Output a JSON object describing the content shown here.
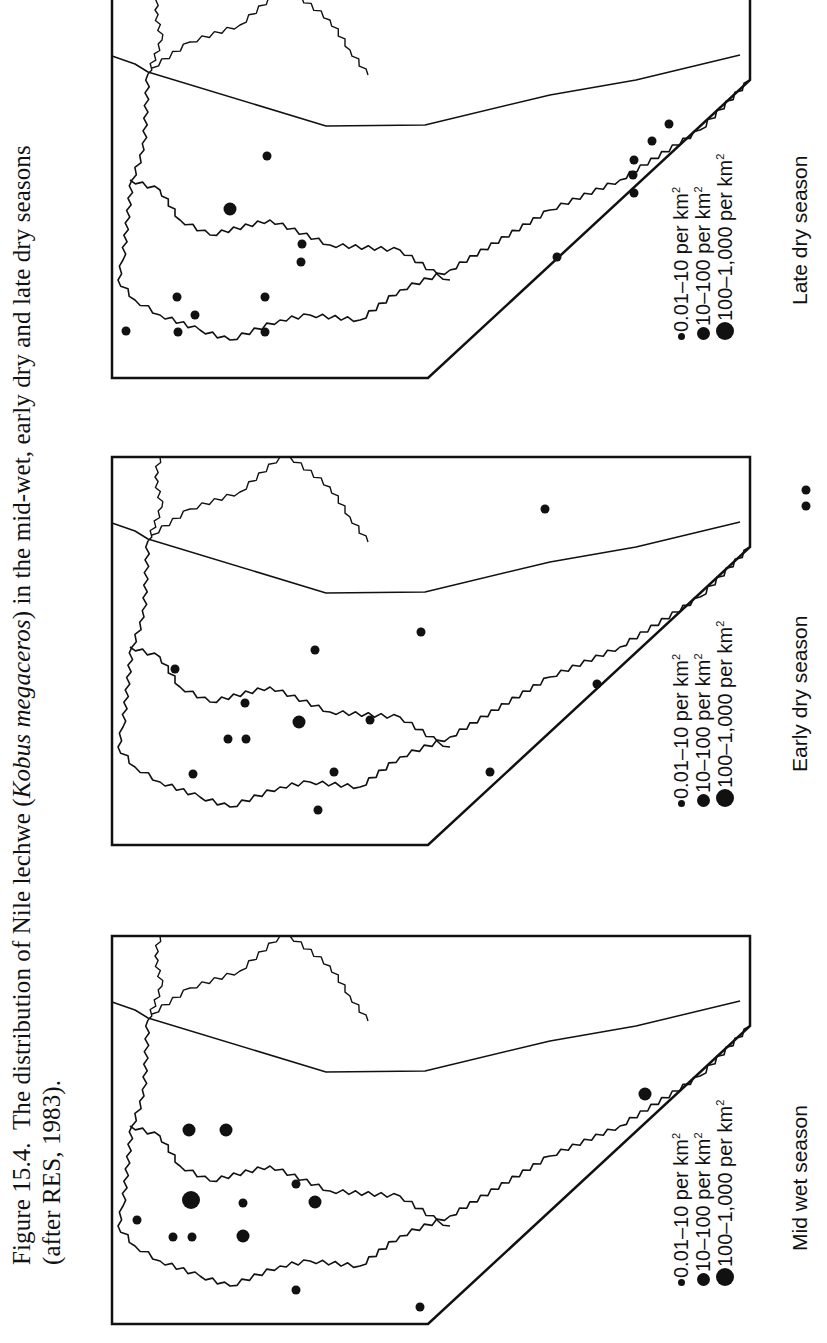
{
  "caption": {
    "figure_label": "Figure 15.4.",
    "text_before_italic": "The distribution of Nile lechwe (",
    "italic": "Kobus megaceros",
    "text_after_italic": ") in the mid-wet, early dry and late dry seasons",
    "line2": "(after RES, 1983)."
  },
  "legend": {
    "items": [
      {
        "label": "0.01–10 per km",
        "sup": "2",
        "size": "small"
      },
      {
        "label": "10–100 per km",
        "sup": "2",
        "size": "medium"
      },
      {
        "label": "100–1,000 per km",
        "sup": "2",
        "size": "large"
      }
    ]
  },
  "panels": [
    {
      "id": "late-dry",
      "title": "Late dry season"
    },
    {
      "id": "early-dry",
      "title": "Early dry season"
    },
    {
      "id": "mid-wet",
      "title": "Mid wet season"
    }
  ],
  "chart_data": {
    "type": "scatter",
    "title": "The distribution of Nile lechwe (Kobus megaceros) in the mid-wet, early dry and late dry seasons (after RES, 1983)",
    "legend": [
      "0.01-10 per km2",
      "10-100 per km2",
      "100-1,000 per km2"
    ],
    "series": [
      {
        "name": "Mid wet season",
        "points_page_xy_class": [
          [
            189,
            1130,
            "medium"
          ],
          [
            226,
            1130,
            "medium"
          ],
          [
            137,
            1220,
            "small"
          ],
          [
            191,
            1200,
            "large"
          ],
          [
            243,
            1203,
            "small"
          ],
          [
            296,
            1184,
            "small"
          ],
          [
            315,
            1202,
            "medium"
          ],
          [
            173,
            1237,
            "small"
          ],
          [
            192,
            1237,
            "small"
          ],
          [
            243,
            1236,
            "medium"
          ],
          [
            296,
            1290,
            "small"
          ],
          [
            420,
            1307,
            "small"
          ],
          [
            645,
            1094,
            "medium"
          ]
        ]
      },
      {
        "name": "Early dry season",
        "points_page_xy_class": [
          [
            175,
            669,
            "small"
          ],
          [
            245,
            703,
            "small"
          ],
          [
            299,
            722,
            "medium"
          ],
          [
            370,
            720,
            "small"
          ],
          [
            228,
            739,
            "small"
          ],
          [
            246,
            739,
            "small"
          ],
          [
            193,
            774,
            "small"
          ],
          [
            334,
            772,
            "small"
          ],
          [
            318,
            810,
            "small"
          ],
          [
            315,
            650,
            "small"
          ],
          [
            421,
            632,
            "small"
          ],
          [
            545,
            509,
            "small"
          ],
          [
            597,
            684,
            "small"
          ],
          [
            490,
            772,
            "small"
          ],
          [
            806,
            490,
            "small"
          ],
          [
            806,
            506,
            "small"
          ]
        ]
      },
      {
        "name": "Late dry season",
        "points_page_xy_class": [
          [
            267,
            156,
            "small"
          ],
          [
            230,
            209,
            "medium"
          ],
          [
            302,
            244,
            "small"
          ],
          [
            301,
            262,
            "small"
          ],
          [
            177,
            297,
            "small"
          ],
          [
            195,
            315,
            "small"
          ],
          [
            265,
            297,
            "small"
          ],
          [
            126,
            331,
            "small"
          ],
          [
            178,
            332,
            "small"
          ],
          [
            265,
            332,
            "small"
          ],
          [
            557,
            257,
            "small"
          ],
          [
            634,
            160,
            "small"
          ],
          [
            633,
            175,
            "small"
          ],
          [
            634,
            193,
            "small"
          ],
          [
            652,
            141,
            "small"
          ],
          [
            669,
            124,
            "small"
          ]
        ]
      }
    ]
  }
}
